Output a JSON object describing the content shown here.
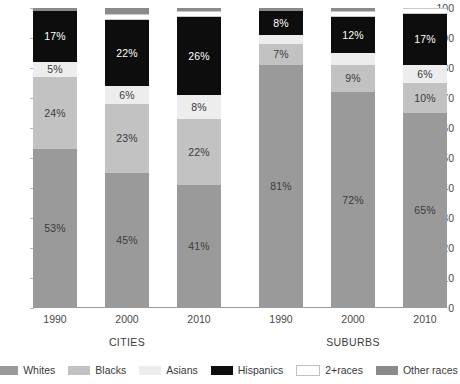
{
  "chart_data": {
    "type": "bar",
    "title": "",
    "subtitle": "",
    "xlabel": "",
    "ylabel": "",
    "ylim": [
      0,
      100
    ],
    "ytick_labels": [
      "0",
      "10",
      "20",
      "30",
      "40",
      "50",
      "60",
      "70",
      "80",
      "90",
      "100"
    ],
    "ytick_values": [
      0,
      10,
      20,
      30,
      40,
      50,
      60,
      70,
      80,
      90,
      100
    ],
    "grid": false,
    "stacked": true,
    "legend_position": "bottom",
    "categories": [
      "1990",
      "2000",
      "2010",
      "1990",
      "2000",
      "2010"
    ],
    "groups": [
      {
        "name": "CITIES",
        "categories": [
          "1990",
          "2000",
          "2010"
        ]
      },
      {
        "name": "SUBURBS",
        "categories": [
          "1990",
          "2000",
          "2010"
        ]
      }
    ],
    "series": [
      {
        "name": "Whites",
        "color": "#9a9a9a",
        "values": [
          53,
          45,
          41,
          81,
          72,
          65
        ]
      },
      {
        "name": "Blacks",
        "color": "#c2c2c2",
        "values": [
          24,
          23,
          22,
          7,
          9,
          10
        ]
      },
      {
        "name": "Asians",
        "color": "#ededed",
        "values": [
          5,
          6,
          8,
          3,
          4,
          6
        ]
      },
      {
        "name": "Hispanics",
        "color": "#0d0d0d",
        "values": [
          17,
          22,
          26,
          8,
          12,
          17
        ]
      },
      {
        "name": "2+races",
        "color": "#ffffff",
        "values": [
          0,
          2,
          2,
          0,
          2,
          2
        ]
      },
      {
        "name": "Other races",
        "color": "#8a8a8a",
        "values": [
          1,
          2,
          1,
          1,
          1,
          0
        ]
      }
    ],
    "bars": [
      {
        "group": "CITIES",
        "category": "1990",
        "segments": [
          {
            "series": "Whites",
            "value": 53,
            "label": "53%",
            "label_style": "dark"
          },
          {
            "series": "Blacks",
            "value": 24,
            "label": "24%",
            "label_style": "dark"
          },
          {
            "series": "Asians",
            "value": 5,
            "label": "5%",
            "label_style": "dark"
          },
          {
            "series": "Hispanics",
            "value": 17,
            "label": "17%",
            "label_style": "light"
          },
          {
            "series": "Other races",
            "value": 1,
            "label": "",
            "label_style": "dark"
          }
        ]
      },
      {
        "group": "CITIES",
        "category": "2000",
        "segments": [
          {
            "series": "Whites",
            "value": 45,
            "label": "45%",
            "label_style": "dark"
          },
          {
            "series": "Blacks",
            "value": 23,
            "label": "23%",
            "label_style": "dark"
          },
          {
            "series": "Asians",
            "value": 6,
            "label": "6%",
            "label_style": "dark"
          },
          {
            "series": "Hispanics",
            "value": 22,
            "label": "22%",
            "label_style": "light"
          },
          {
            "series": "2+races",
            "value": 2,
            "label": "",
            "label_style": "dark"
          },
          {
            "series": "Other races",
            "value": 2,
            "label": "",
            "label_style": "dark"
          }
        ]
      },
      {
        "group": "CITIES",
        "category": "2010",
        "segments": [
          {
            "series": "Whites",
            "value": 41,
            "label": "41%",
            "label_style": "dark"
          },
          {
            "series": "Blacks",
            "value": 22,
            "label": "22%",
            "label_style": "dark"
          },
          {
            "series": "Asians",
            "value": 8,
            "label": "8%",
            "label_style": "dark"
          },
          {
            "series": "Hispanics",
            "value": 26,
            "label": "26%",
            "label_style": "light"
          },
          {
            "series": "2+races",
            "value": 2,
            "label": "",
            "label_style": "dark"
          },
          {
            "series": "Other races",
            "value": 1,
            "label": "",
            "label_style": "dark"
          }
        ]
      },
      {
        "group": "SUBURBS",
        "category": "1990",
        "segments": [
          {
            "series": "Whites",
            "value": 81,
            "label": "81%",
            "label_style": "dark"
          },
          {
            "series": "Blacks",
            "value": 7,
            "label": "7%",
            "label_style": "dark"
          },
          {
            "series": "Asians",
            "value": 3,
            "label": "",
            "label_style": "dark"
          },
          {
            "series": "Hispanics",
            "value": 8,
            "label": "8%",
            "label_style": "light"
          },
          {
            "series": "Other races",
            "value": 1,
            "label": "",
            "label_style": "dark"
          }
        ]
      },
      {
        "group": "SUBURBS",
        "category": "2000",
        "segments": [
          {
            "series": "Whites",
            "value": 72,
            "label": "72%",
            "label_style": "dark"
          },
          {
            "series": "Blacks",
            "value": 9,
            "label": "9%",
            "label_style": "dark"
          },
          {
            "series": "Asians",
            "value": 4,
            "label": "",
            "label_style": "dark"
          },
          {
            "series": "Hispanics",
            "value": 12,
            "label": "12%",
            "label_style": "light"
          },
          {
            "series": "2+races",
            "value": 2,
            "label": "",
            "label_style": "dark"
          },
          {
            "series": "Other races",
            "value": 1,
            "label": "",
            "label_style": "dark"
          }
        ]
      },
      {
        "group": "SUBURBS",
        "category": "2010",
        "segments": [
          {
            "series": "Whites",
            "value": 65,
            "label": "65%",
            "label_style": "dark"
          },
          {
            "series": "Blacks",
            "value": 10,
            "label": "10%",
            "label_style": "dark"
          },
          {
            "series": "Asians",
            "value": 6,
            "label": "6%",
            "label_style": "dark"
          },
          {
            "series": "Hispanics",
            "value": 17,
            "label": "17%",
            "label_style": "light"
          },
          {
            "series": "2+races",
            "value": 2,
            "label": "",
            "label_style": "dark"
          }
        ]
      }
    ],
    "legend": [
      {
        "label": "Whites",
        "color": "#9a9a9a"
      },
      {
        "label": "Blacks",
        "color": "#c2c2c2"
      },
      {
        "label": "Asians",
        "color": "#ededed"
      },
      {
        "label": "Hispanics",
        "color": "#0d0d0d"
      },
      {
        "label": "2+races",
        "color": "#ffffff"
      },
      {
        "label": "Other races",
        "color": "#8a8a8a"
      }
    ]
  }
}
